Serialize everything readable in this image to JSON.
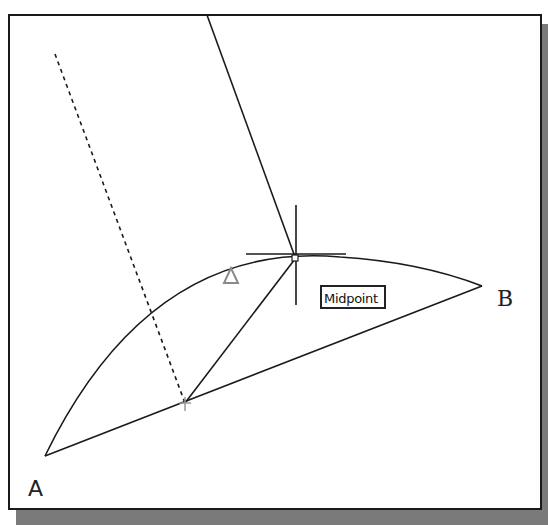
{
  "figure": {
    "type": "CAD object snap illustration",
    "points": {
      "A": {
        "label": "A",
        "x": 45,
        "y": 456
      },
      "B": {
        "label": "B",
        "x": 482,
        "y": 286
      },
      "arc_midpoint": {
        "x": 295,
        "y": 259
      },
      "chord_midpoint": {
        "x": 185,
        "y": 403
      }
    },
    "tooltip": {
      "text": "Midpoint"
    },
    "elements": [
      "arc from A to B",
      "chord line A to B",
      "dashed perpendicular bisector through chord midpoint",
      "line from chord midpoint to arc midpoint",
      "rubber-band line from top edge to cursor",
      "crosshair cursor at arc midpoint",
      "midpoint snap marker (triangle) on arc"
    ],
    "colors": {
      "line": "#1a1a1a",
      "marker": "#8a8a8a",
      "shadow": "#7a7a7a",
      "background": "#ffffff"
    }
  }
}
